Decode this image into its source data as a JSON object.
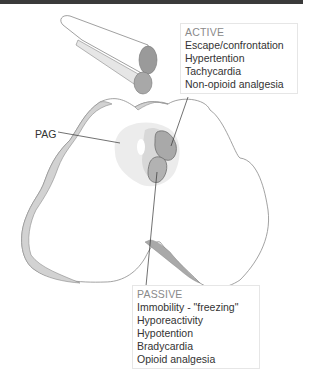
{
  "labels": {
    "pag": "PAG"
  },
  "active": {
    "heading": "ACTIVE",
    "items": [
      "Escape/confrontation",
      "Hypertention",
      "Tachycardia",
      "Non-opioid analgesia"
    ]
  },
  "passive": {
    "heading": "PASSIVE",
    "items": [
      "Immobility - \"freezing\"",
      "Hyporeactivity",
      "Hypotention",
      "Bradycardia",
      "Opioid analgesia"
    ]
  },
  "colors": {
    "outline": "#7a7a7a",
    "rim_fill": "#cfcfcf",
    "pag_fill": "#ececec",
    "column_fill": "#b5b5b5",
    "leader_line": "#333333"
  }
}
